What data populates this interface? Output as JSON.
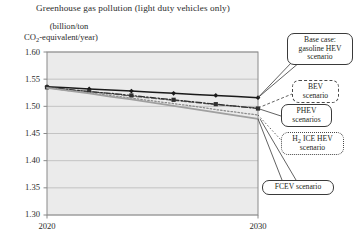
{
  "chart_data": {
    "type": "line",
    "title": "Greenhouse gas pollution (light duty vehicles only)",
    "ylabel_line1": "(billion/ton",
    "ylabel_line2_pre": "CO",
    "ylabel_line2_sub": "2",
    "ylabel_line2_post": "-equivalent/year)",
    "xlabel": "",
    "x": [
      2020,
      2021,
      2022,
      2023,
      2024,
      2025,
      2026,
      2027,
      2028,
      2029,
      2030
    ],
    "xlim": [
      2020,
      2030
    ],
    "ylim": [
      1.3,
      1.6
    ],
    "yticks": [
      "1.60",
      "1.55",
      "1.50",
      "1.45",
      "1.40",
      "1.35",
      "1.30"
    ],
    "ytick_values": [
      1.6,
      1.55,
      1.5,
      1.45,
      1.4,
      1.35,
      1.3
    ],
    "xticks": [
      "2020",
      "2030"
    ],
    "xtick_values": [
      2020,
      2030
    ],
    "grid": true,
    "legend_position": "callout-annotations-right",
    "series": [
      {
        "name": "Base case: gasoline HEV scenario",
        "style": "solid-black-markers",
        "color": "#1a1a1a",
        "values": [
          1.536,
          1.534,
          1.532,
          1.53,
          1.528,
          1.526,
          1.524,
          1.522,
          1.52,
          1.518,
          1.516
        ]
      },
      {
        "name": "BEV scenario",
        "style": "dashed-gray",
        "color": "#6e6e6e",
        "values": [
          1.535,
          1.531,
          1.527,
          1.523,
          1.519,
          1.515,
          1.511,
          1.507,
          1.503,
          1.5,
          1.497
        ]
      },
      {
        "name": "PHEV scenarios",
        "style": "dash-dot-dark-markers",
        "color": "#2f2f2f",
        "values": [
          1.535,
          1.531,
          1.527,
          1.524,
          1.52,
          1.516,
          1.512,
          1.508,
          1.504,
          1.5,
          1.496
        ]
      },
      {
        "name": "H2 ICE HEV scenario",
        "style": "dash-dot-light",
        "color": "#8a8a8a",
        "values": [
          1.534,
          1.529,
          1.525,
          1.52,
          1.515,
          1.51,
          1.505,
          1.5,
          1.494,
          1.489,
          1.484
        ]
      },
      {
        "name": "FCEV scenario",
        "style": "solid-light-gray",
        "color": "#a0a0a0",
        "values": [
          1.534,
          1.529,
          1.524,
          1.518,
          1.513,
          1.507,
          1.501,
          1.495,
          1.489,
          1.483,
          1.477
        ]
      }
    ]
  },
  "callouts": {
    "base_case": "Base case:\ngasoline HEV\nscenario",
    "base_case_l1": "Base case:",
    "base_case_l2": "gasoline HEV",
    "base_case_l3": "scenario",
    "bev_l1": "BEV",
    "bev_l2": "scenario",
    "phev_l1": "PHEV",
    "phev_l2": "scenarios",
    "h2_l1_pre": "H",
    "h2_l1_sub": "2",
    "h2_l1_post": " ICE HEV",
    "h2_l2": "scenario",
    "fcev": "FCEV scenario"
  },
  "colors": {
    "plot_bg": "#ebebeb",
    "grid": "#b9b9b9",
    "axis": "#8a8a8a",
    "text": "#231f20"
  }
}
